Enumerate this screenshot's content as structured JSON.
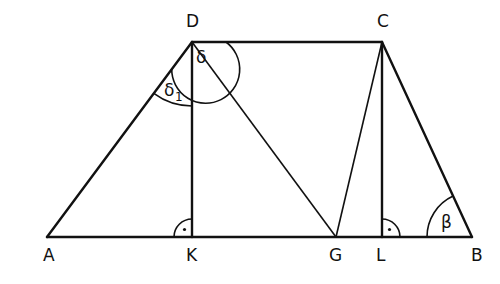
{
  "diagram": {
    "type": "trapezoid",
    "stroke_color": "#111111",
    "background": "#ffffff",
    "points": {
      "A": {
        "label": "A",
        "x": 47,
        "y": 237
      },
      "B": {
        "label": "B",
        "x": 472,
        "y": 237
      },
      "C": {
        "label": "C",
        "x": 382,
        "y": 42
      },
      "D": {
        "label": "D",
        "x": 192,
        "y": 42
      },
      "K": {
        "label": "K",
        "x": 192,
        "y": 237
      },
      "G": {
        "label": "G",
        "x": 336,
        "y": 237
      },
      "L": {
        "label": "L",
        "x": 382,
        "y": 237
      }
    },
    "segments": [
      "AB",
      "BC",
      "CD",
      "DA",
      "DK",
      "CL",
      "DG",
      "CG"
    ],
    "angles": {
      "delta": {
        "label": "δ",
        "vertex": "D"
      },
      "delta1": {
        "label": "δ",
        "subscript": "1",
        "vertex": "D"
      },
      "beta": {
        "label": "β",
        "vertex": "B"
      },
      "right_K": {
        "vertex": "K",
        "marker": "right-angle-dot"
      },
      "right_L": {
        "vertex": "L",
        "marker": "right-angle-dot"
      }
    }
  }
}
